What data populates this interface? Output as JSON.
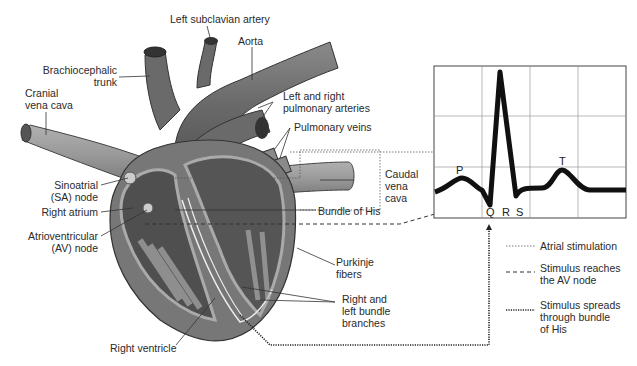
{
  "labels": {
    "left_subclavian_artery": "Left subclavian artery",
    "aorta": "Aorta",
    "brachiocephalic_trunk": "Brachiocephalic\ntrunk",
    "cranial_vena_cava": "Cranial\nvena cava",
    "pulmonary_arteries": "Left and right\npulmonary arteries",
    "pulmonary_veins": "Pulmonary veins",
    "caudal_vena_cava": "Caudal\nvena\ncava",
    "sa_node": "Sinoatrial\n(SA) node",
    "right_atrium": "Right atrium",
    "av_node": "Atrioventricular\n(AV) node",
    "bundle_of_his": "Bundle of His",
    "purkinje_fibers": "Purkinje\nfibers",
    "bundle_branches": "Right and\nleft bundle\nbranches",
    "right_ventricle": "Right ventricle"
  },
  "ecg": {
    "waves": {
      "p": "P",
      "q": "Q",
      "r": "R",
      "s": "S",
      "t": "T"
    }
  },
  "legend": [
    {
      "style": "dotted-fine",
      "label": "Atrial stimulation"
    },
    {
      "style": "dashed",
      "label": "Stimulus reaches\nthe AV node"
    },
    {
      "style": "dotted-bold",
      "label": "Stimulus spreads\nthrough bundle\nof His"
    }
  ],
  "colors": {
    "vessel": "#6e6e6e",
    "vessel_dark": "#4a4a4a",
    "chamber": "#555555",
    "wall": "#9a9a9a",
    "line": "#333333"
  }
}
